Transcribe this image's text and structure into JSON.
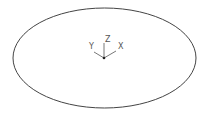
{
  "drawing": {
    "background": "#ffffff",
    "stroke_color": "#444444",
    "ellipse": {
      "cx": 104.5,
      "cy": 58,
      "rx": 91.5,
      "ry": 50
    },
    "ucs_icon": {
      "origin": {
        "x": 104,
        "y": 58
      },
      "axes": {
        "x": {
          "label": "X",
          "end": {
            "x": 116,
            "y": 51
          }
        },
        "y": {
          "label": "Y",
          "end": {
            "x": 94,
            "y": 52
          }
        },
        "z": {
          "label": "Z",
          "end": {
            "x": 104,
            "y": 43
          }
        }
      }
    }
  }
}
